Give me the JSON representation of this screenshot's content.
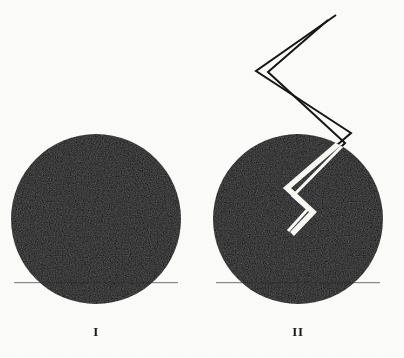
{
  "figure": {
    "background_color": "#fbfbf9",
    "ink_color": "#0d0d0d",
    "crack_color": "#f7f7f4",
    "panels": [
      {
        "id": "panel-i",
        "label": "I",
        "shape": "filled-circle",
        "description": "solid dark sphere, intact",
        "center_x": 96,
        "center_y": 219,
        "radius": 85,
        "has_crack": false,
        "label_x": 96,
        "label_y": 332
      },
      {
        "id": "panel-ii",
        "label": "II",
        "shape": "filled-circle",
        "description": "solid dark sphere with zigzag crack entering from upper right",
        "center_x": 298,
        "center_y": 219,
        "radius": 85,
        "has_crack": true,
        "label_x": 298,
        "label_y": 332
      }
    ],
    "crack": {
      "name": "zigzag-crack",
      "stroke_width_outside": 2,
      "stroke_width_inside": 5,
      "outside_stroke_color": "#141414",
      "inside_stroke_color": "#f7f7f4",
      "points": [
        [
          336,
          15
        ],
        [
          256,
          71
        ],
        [
          351,
          133
        ],
        [
          287,
          188
        ],
        [
          313,
          212
        ],
        [
          292,
          234
        ]
      ],
      "outer_offset_points": [
        [
          328,
          20
        ],
        [
          268,
          72
        ],
        [
          345,
          143
        ],
        [
          293,
          196
        ],
        [
          308,
          209
        ],
        [
          288,
          231
        ]
      ]
    }
  }
}
